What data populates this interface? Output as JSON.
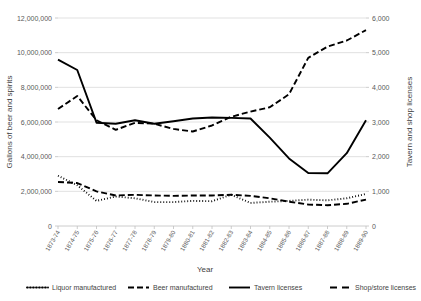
{
  "chart_data": {
    "type": "line",
    "title": "",
    "xlabel": "Year",
    "ylabel": "Gallons of beer and spirits",
    "y2label": "Tavern and shop licenses",
    "grid": true,
    "legend_position": "bottom",
    "ylim": [
      0,
      12000000
    ],
    "y2lim": [
      0,
      6000
    ],
    "ytick_labels": [
      "0",
      "2,000,000",
      "4,000,000",
      "6,000,000",
      "8,000,000",
      "10,000,000",
      "12,000,000"
    ],
    "ytick_values": [
      0,
      2000000,
      4000000,
      6000000,
      8000000,
      10000000,
      12000000
    ],
    "y2tick_labels": [
      "0",
      "1,000",
      "2,000",
      "3,000",
      "4,000",
      "5,000",
      "6,000"
    ],
    "y2tick_values": [
      0,
      1000,
      2000,
      3000,
      4000,
      5000,
      6000
    ],
    "categories": [
      "1873-74",
      "1874-75",
      "1875-76",
      "1876-77",
      "1877-78",
      "1878-79",
      "1879-80",
      "1880-81",
      "1881-82",
      "1882-83",
      "1883-84",
      "1884-85",
      "1885-86",
      "1886-87",
      "1887-88",
      "1888-89",
      "1889-90"
    ],
    "series": [
      {
        "name": "Liquor manufactured",
        "axis": "left",
        "style": "dotted",
        "values": [
          2900000,
          2350000,
          1450000,
          1700000,
          1600000,
          1380000,
          1380000,
          1450000,
          1430000,
          1800000,
          1330000,
          1400000,
          1450000,
          1520000,
          1480000,
          1600000,
          1850000
        ]
      },
      {
        "name": "Beer manufactured",
        "axis": "left",
        "style": "dashed",
        "values": [
          6750000,
          7500000,
          6100000,
          5550000,
          5950000,
          5900000,
          5600000,
          5450000,
          5800000,
          6300000,
          6600000,
          6850000,
          7600000,
          9700000,
          10350000,
          10700000,
          11300000
        ]
      },
      {
        "name": "Tavern licenses",
        "axis": "right",
        "style": "solid",
        "values": [
          4800,
          4500,
          2980,
          2950,
          3050,
          2950,
          3020,
          3100,
          3130,
          3120,
          3100,
          2550,
          1950,
          1530,
          1520,
          2100,
          3050
        ]
      },
      {
        "name": "Shop/store licenses",
        "axis": "right",
        "style": "dashed",
        "values": [
          1270,
          1240,
          1000,
          880,
          900,
          880,
          870,
          880,
          880,
          900,
          870,
          800,
          700,
          620,
          600,
          640,
          760
        ]
      }
    ]
  },
  "legend": {
    "items": [
      {
        "label": "Liquor manufactured",
        "style": "dotted"
      },
      {
        "label": "Beer manufactured",
        "style": "dashed"
      },
      {
        "label": "Tavern licenses",
        "style": "solid"
      },
      {
        "label": "Shop/store licenses",
        "style": "longdash"
      }
    ]
  }
}
